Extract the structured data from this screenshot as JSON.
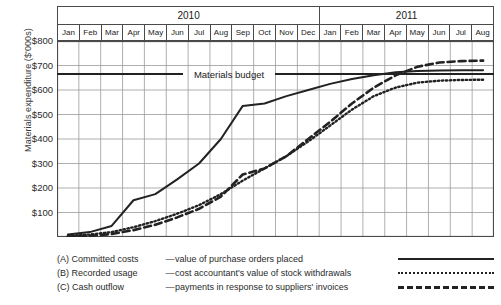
{
  "chart_data": {
    "type": "line",
    "title": "",
    "xlabel": "",
    "ylabel": "Materials expenditure ($'000s)",
    "ylim": [
      0,
      800
    ],
    "ytick_labels": [
      "$800",
      "$700",
      "$600",
      "$500",
      "$400",
      "$300",
      "$200",
      "$100"
    ],
    "ytick_values": [
      800,
      700,
      600,
      500,
      400,
      300,
      200,
      100
    ],
    "grid": true,
    "legend_position": "below",
    "year_groups": [
      {
        "label": "2010",
        "months": 12
      },
      {
        "label": "2011",
        "months": 8
      }
    ],
    "categories": [
      "Jan",
      "Feb",
      "Mar",
      "Apr",
      "May",
      "Jun",
      "Jul",
      "Aug",
      "Sep",
      "Oct",
      "Nov",
      "Dec",
      "Jan",
      "Feb",
      "Mar",
      "Apr",
      "May",
      "Jun",
      "Jul",
      "Aug"
    ],
    "annotations": [
      {
        "text": "Materials budget",
        "type": "threshold-line",
        "value": 665,
        "style": "solid"
      }
    ],
    "series": [
      {
        "name": "Committed costs",
        "key": "A",
        "style": "solid",
        "values": [
          10,
          20,
          45,
          150,
          175,
          235,
          300,
          400,
          535,
          545,
          575,
          600,
          625,
          645,
          660,
          672,
          678,
          680,
          681,
          681
        ]
      },
      {
        "name": "Recorded usage",
        "key": "B",
        "style": "dotted",
        "values": [
          5,
          10,
          20,
          40,
          65,
          95,
          130,
          175,
          230,
          280,
          330,
          390,
          455,
          520,
          575,
          610,
          630,
          638,
          641,
          642
        ]
      },
      {
        "name": "Cash outflow",
        "key": "C",
        "style": "dashed",
        "values": [
          2,
          5,
          12,
          28,
          50,
          80,
          115,
          165,
          255,
          280,
          330,
          400,
          470,
          545,
          610,
          660,
          695,
          712,
          718,
          720
        ]
      }
    ]
  },
  "legend": {
    "rows": [
      {
        "key": "(A) Committed costs",
        "dash": "—",
        "description": "value of purchase orders placed",
        "style": "solid"
      },
      {
        "key": "(B) Recorded usage",
        "dash": "—",
        "description": "cost accountant's value of stock withdrawals",
        "style": "dotted"
      },
      {
        "key": "(C) Cash outflow",
        "dash": "—",
        "description": "payments in response to suppliers' invoices",
        "style": "dashed"
      }
    ]
  },
  "colors": {
    "line": "#222222",
    "grid": "#9a9a9a",
    "axis": "#4a4a4a",
    "text": "#1a1a1a",
    "background": "#ffffff"
  }
}
